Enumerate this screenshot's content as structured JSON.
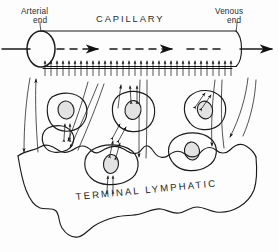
{
  "figure": {
    "name": "capillary-terminal-lymphatic-diagram",
    "background_color": "#fdfdfd",
    "ink_color": "#1a1a1a",
    "nucleus_fill_color": "#e3e3e3",
    "width": 278,
    "height": 252
  },
  "labels": {
    "arterial_end_line1": "Arterial",
    "arterial_end_line2": "end",
    "capillary": "CAPILLARY",
    "venous_end_line1": "Venous",
    "venous_end_line2": "end",
    "terminal_lymphatic": "TERMINAL  LYMPHATIC"
  },
  "structures": {
    "capillary_vessel": "capillary tube shown in cutaway with elliptical open ends",
    "blood_flow": "dashed axial arrows indicating blood flow from arterial to venous end",
    "filtration_arrows": "row of short upward arrows along capillary wall indicating fluid movement into interstitium",
    "interstitial_cells": "six tissue cells with nuclei and paired double-headed arrows",
    "lymphatic_lumen": "irregular wavy outline of terminal lymphatic vessel",
    "interstitial_flow_lines": "long curving streamlines with arrowheads showing interstitial fluid flow toward lymphatic"
  },
  "counts": {
    "filtration_arrows": 32,
    "interstitial_cells": 6,
    "axial_flow_arrowheads": 3
  }
}
